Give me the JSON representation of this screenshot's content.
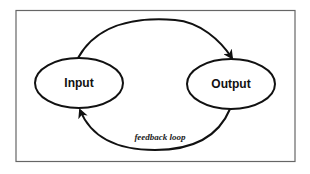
{
  "diagram": {
    "type": "feedback-loop",
    "frame": {
      "stroke": "#555555",
      "fill": "#ffffff"
    },
    "nodes": [
      {
        "id": "input",
        "label": "Input"
      },
      {
        "id": "output",
        "label": "Output"
      }
    ],
    "edges": [
      {
        "from": "input",
        "to": "output",
        "label": ""
      },
      {
        "from": "output",
        "to": "input",
        "label": "feedback loop"
      }
    ],
    "colors": {
      "stroke": "#111111",
      "background": "#ffffff"
    }
  }
}
